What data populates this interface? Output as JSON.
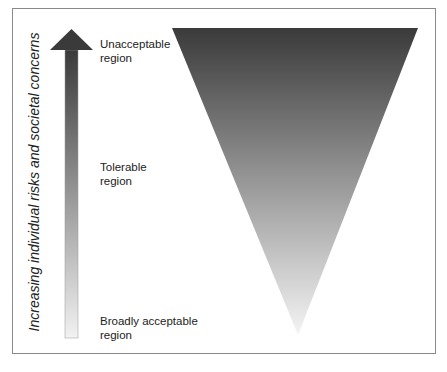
{
  "diagram": {
    "axis_label": "Increasing individual risks and societal concerns",
    "regions": [
      {
        "line1": "Unacceptable",
        "line2": "region"
      },
      {
        "line1": "Tolerable",
        "line2": "region"
      },
      {
        "line1": "Broadly acceptable",
        "line2": "region"
      }
    ],
    "colors": {
      "dark": "#3a3a3a",
      "light": "#f2f2f2",
      "border": "#8a8a8a"
    }
  }
}
